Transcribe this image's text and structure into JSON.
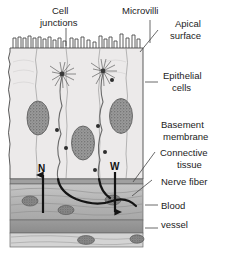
{
  "figure": {
    "title_alt": "Epithelium cross-section with nerve endings",
    "background": "#ffffff"
  },
  "labels": {
    "cell_junctions_line1": "Cell",
    "cell_junctions_line2": "junctions",
    "microvilli": "Microvilli",
    "apical_line1": "Apical",
    "apical_line2": "surface",
    "epithelial_line1": "Epithelial",
    "epithelial_line2": "cells",
    "basement_line1": "Basement",
    "basement_line2": "membrane",
    "connective_line1": "Connective",
    "connective_line2": "tissue",
    "nerve_fiber": "Nerve fiber",
    "blood_line1": "Blood",
    "blood_line2": "vessel"
  },
  "markers": {
    "n": "N",
    "w": "W"
  },
  "colors": {
    "epithelium_fill": "#eceaea",
    "connective_fill": "#b9b9b9",
    "vessel_band_fill": "#9a9a9a",
    "vessel_lumen_fill": "#d2d2d2",
    "nucleus_fill": "#8e8e8e",
    "outline": "#3c3c3c",
    "nerve_black": "#141414",
    "label_text": "#1c1c1c"
  },
  "structures": {
    "microvilli_count": 26,
    "epithelial_nuclei": 3,
    "nerve_ending_clusters": 2,
    "connective_nuclei": 4,
    "vessel_nuclei": 2
  }
}
